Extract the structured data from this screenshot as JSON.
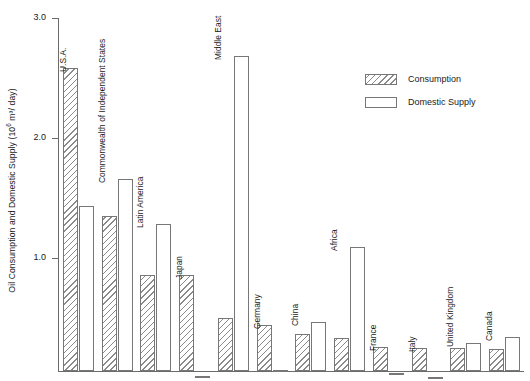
{
  "chart_data": {
    "type": "bar",
    "title": "",
    "xlabel": "",
    "ylabel": "Oil Consumption and Domestic Supply (10⁶ m³/ day)",
    "ylabel_prefix": "Oil Consumption and Domestic Supply (10",
    "ylabel_exponent": "6",
    "ylabel_suffix": " m³/ day)",
    "ylim": [
      0,
      3.15
    ],
    "ytick_labels": [
      "3.0",
      "2.0",
      "1.0"
    ],
    "ytick_values": [
      3.0,
      2.0,
      1.0
    ],
    "grid": false,
    "legend_position": "upper right",
    "categories": [
      "U.S.A.",
      "Commonwealth of Independent States",
      "Latin America",
      "Japan",
      "Middle East",
      "Germany",
      "China",
      "Africa",
      "France",
      "Italy",
      "United Kingdom",
      "Canada"
    ],
    "series": [
      {
        "name": "Consumption",
        "values": [
          2.58,
          1.35,
          0.86,
          0.86,
          0.5,
          0.44,
          0.37,
          0.33,
          0.26,
          0.25,
          0.25,
          0.24
        ]
      },
      {
        "name": "Domestic Supply",
        "values": [
          1.43,
          1.66,
          1.28,
          0.02,
          2.68,
          0.07,
          0.47,
          1.09,
          0.04,
          0.01,
          0.29,
          0.34
        ]
      }
    ]
  },
  "legend": {
    "items": [
      {
        "label": "Consumption",
        "pattern": "hatched"
      },
      {
        "label": "Domestic Supply",
        "pattern": "solid"
      }
    ]
  },
  "colors": {
    "axis": "#6b6b6b",
    "bar_outline": "#777777",
    "hatch": "#8a8a8a",
    "background": "#ffffff",
    "text": "#1a1a1a"
  }
}
